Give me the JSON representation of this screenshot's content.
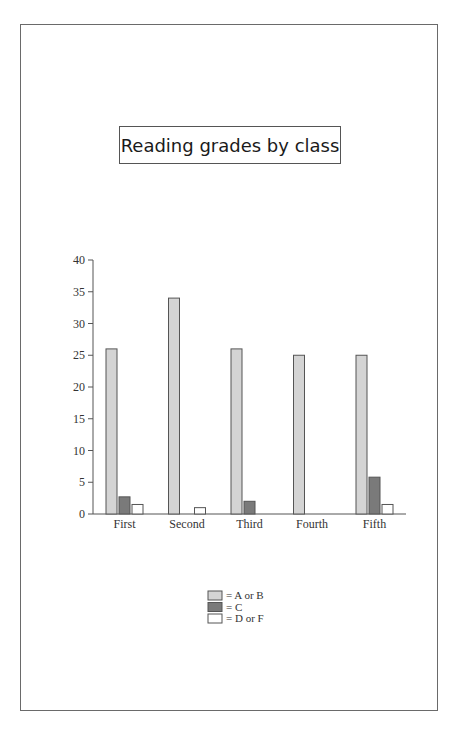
{
  "chart_data": {
    "type": "bar",
    "title": "Reading grades by class",
    "xlabel": "",
    "ylabel": "",
    "ylim": [
      0,
      40
    ],
    "yticks": [
      0,
      5,
      10,
      15,
      20,
      25,
      30,
      35,
      40
    ],
    "grid": false,
    "categories": [
      "First",
      "Second",
      "Third",
      "Fourth",
      "Fifth"
    ],
    "series": [
      {
        "name": "= A or B",
        "color": "#d4d4d4",
        "values": [
          26,
          34,
          26,
          25,
          25
        ]
      },
      {
        "name": "= C",
        "color": "#7a7a7a",
        "values": [
          2.7,
          0,
          2,
          0,
          5.8
        ]
      },
      {
        "name": "= D or F",
        "color": "#ffffff",
        "values": [
          1.5,
          1,
          0,
          0,
          1.5
        ]
      }
    ],
    "legend_position": "bottom-center"
  }
}
